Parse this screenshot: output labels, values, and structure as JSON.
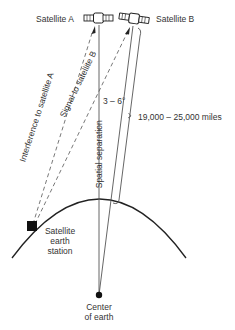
{
  "diagram": {
    "satellite_a_label": "Satellite A",
    "satellite_b_label": "Satellite B",
    "interference_label": "Interference to satellite A",
    "signal_label": "Signal to satellite B",
    "angle_label": "3 – 6°",
    "separation_label": "Spatial separation",
    "distance_label": "19,000 – 25,000 miles",
    "earth_station_label": [
      "Satellite",
      "earth",
      "station"
    ],
    "center_label": [
      "Center",
      "of earth"
    ],
    "colors": {
      "line": "#444444",
      "fill": "#111111",
      "text": "#333333"
    }
  }
}
